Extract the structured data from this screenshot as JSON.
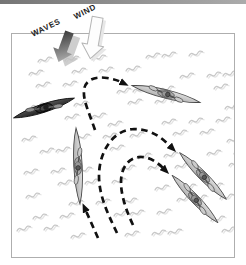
{
  "labels": {
    "waves": "WAVES",
    "wind": "WIND"
  },
  "icons": {
    "waves_arrow": "block-arrow-pointing-down-left",
    "wind_arrow": "outlined-block-arrow-pointing-down"
  },
  "frame": {
    "x": 11,
    "y": 33,
    "width": 224,
    "height": 225
  },
  "colors": {
    "route": "#111111",
    "frame_border": "#aeaeae",
    "label_color": "#1c1c1c",
    "top_bar_left": "#757575",
    "top_bar_right": "#ababab",
    "squiggle": "#c8c8c8",
    "squiggle_echo": "#e4e4e4",
    "waves_arrow_dark": "#303030",
    "waves_arrow_light": "#a5a5a5",
    "waves_ghost": "#c2c2c2",
    "wind_fill": "#fdfdfd",
    "wind_stroke": "#b5b5b5",
    "wind_shadow": "#e7e7e7",
    "kayak_light_top": "#e0e0e0",
    "kayak_light_bottom": "#b0b0b0",
    "kayak_dark_top": "#565656",
    "kayak_dark_bottom": "#222222"
  },
  "kayaks": [
    {
      "name": "kayak-dark-start",
      "cx": 44,
      "cy": 108,
      "angle": -18,
      "len": 64,
      "variant": "dark"
    },
    {
      "name": "kayak-top-right",
      "cx": 166,
      "cy": 94,
      "angle": 14,
      "len": 70,
      "variant": "light"
    },
    {
      "name": "kayak-left-vertical",
      "cx": 78,
      "cy": 166,
      "angle": 87,
      "len": 76,
      "variant": "light"
    },
    {
      "name": "kayak-right-upper",
      "cx": 203,
      "cy": 176,
      "angle": 45,
      "len": 66,
      "variant": "light"
    },
    {
      "name": "kayak-right-lower",
      "cx": 195,
      "cy": 199,
      "angle": 46,
      "len": 66,
      "variant": "light"
    }
  ],
  "routes": [
    {
      "name": "route-turn-to-top-right",
      "d": "M 95,130 C 89,112 83,101 84,90 C 85,80 95,76 107,78 C 113,79 117,80 121,82"
    },
    {
      "name": "route-outer-arch",
      "d": "M 117,233 C 108,214 99,196 99,176 C 99,153 112,130 134,129 C 152,129 163,139 170,146"
    },
    {
      "name": "route-inner-arch",
      "d": "M 133,225 C 125,208 121,194 121,182 C 121,166 130,157 141,157 C 150,157 157,162 163,168"
    },
    {
      "name": "route-to-vertical-kayak",
      "d": "M 98,238 C 94,229 90,220 86,211"
    }
  ],
  "wave_texture": {
    "rows": 12,
    "cols": 9,
    "x0": 16,
    "y0": 58,
    "step_x": 25,
    "step_y": 16,
    "rotation": -14
  }
}
